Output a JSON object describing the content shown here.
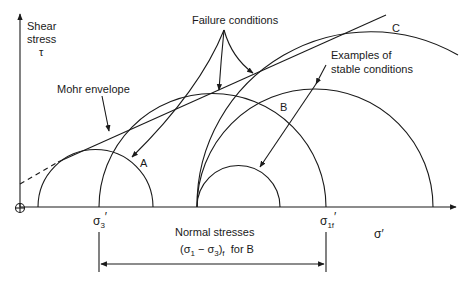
{
  "figure": {
    "axes": {
      "y_label_line1": "Shear",
      "y_label_line2": "stress",
      "y_label_symbol": "τ",
      "x_label": "σ′",
      "origin_symbol": "⊕"
    },
    "annotations": {
      "failure_conditions": "Failure conditions",
      "mohr_envelope": "Mohr envelope",
      "stable_line1": "Examples of",
      "stable_line2": "stable conditions",
      "circle_a": "A",
      "circle_b": "B",
      "circle_c": "C"
    },
    "ticks": {
      "sigma3": "σ",
      "sigma3_sub": "3",
      "sigma3_prime": "′",
      "sigma1f": "σ",
      "sigma1f_sub": "1f",
      "sigma1f_prime": "′"
    },
    "dimension": {
      "line1": "Normal stresses",
      "line2_open": "(σ",
      "line2_sub1": "1",
      "line2_mid": " − σ",
      "line2_sub3": "3",
      "line2_close": ")",
      "line2_subf": "f",
      "line2_tail": "  for B"
    },
    "circles": [
      {
        "name": "A",
        "type": "failure",
        "left": 38,
        "right": 153
      },
      {
        "name": "large",
        "type": "failure",
        "left": 99,
        "right": 326
      },
      {
        "name": "small",
        "type": "stable",
        "left": 197,
        "right": 280
      },
      {
        "name": "B",
        "type": "stable",
        "left": 197,
        "right": 433
      },
      {
        "name": "C",
        "type": "failure",
        "left": 197,
        "right": 545
      }
    ]
  }
}
